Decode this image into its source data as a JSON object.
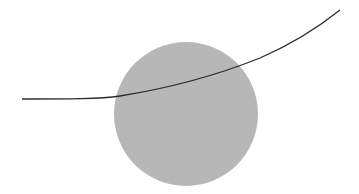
{
  "diagram": {
    "background": "#ffffff",
    "circle": {
      "cx": 186,
      "cy": 114,
      "r": 72,
      "fill": "#b7b7b7"
    },
    "curve": {
      "path": "M 22 99 C 70 99, 100 99, 120 96 C 170 88, 220 74, 260 58 C 290 45, 315 30, 340 10",
      "stroke": "#2a2a2a",
      "stroke_width": 1.3
    }
  }
}
